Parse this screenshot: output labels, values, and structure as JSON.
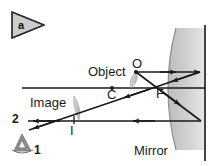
{
  "figure": {
    "panel_label": "a",
    "background_color": "#ffffff",
    "ink_color": "#1a1a1a",
    "shade_color": "#c9c9c9"
  },
  "labels": {
    "object": "Object",
    "image": "Image",
    "mirror": "Mirror",
    "point_o": "O",
    "point_c": "C",
    "point_f": "F",
    "point_i": "I",
    "ray_1": "1",
    "ray_2": "2"
  },
  "diagram_data": {
    "type": "optics-ray-diagram",
    "description": "Concave mirror ray diagram: an object beyond the center of curvature forms a real, inverted image between C and F; an eye at lower left views the image.",
    "elements": [
      {
        "name": "principal-axis",
        "kind": "line",
        "x1": 22,
        "y1": 88,
        "x2": 205,
        "y2": 88
      },
      {
        "name": "mirror-surface",
        "kind": "arc",
        "vertex_x": 200,
        "vertex_y": 88,
        "top_x": 178,
        "top_y": 30,
        "bottom_x": 178,
        "bottom_y": 150
      },
      {
        "name": "mirror-back-line",
        "kind": "line",
        "x1": 205,
        "y1": 26,
        "x2": 205,
        "y2": 160
      },
      {
        "name": "object-point-O",
        "kind": "point",
        "x": 136,
        "y": 72
      },
      {
        "name": "center-of-curvature-C",
        "kind": "point",
        "x": 112,
        "y": 88
      },
      {
        "name": "focal-point-F",
        "kind": "point",
        "x": 160,
        "y": 88
      },
      {
        "name": "image-point-I",
        "kind": "point",
        "x": 74,
        "y": 120
      },
      {
        "name": "ray-parallel-incident",
        "kind": "ray",
        "x1": 136,
        "y1": 72,
        "x2": 200,
        "y2": 72,
        "arrow": "mid"
      },
      {
        "name": "ray-parallel-reflected-through-F",
        "kind": "ray",
        "x1": 200,
        "y1": 72,
        "x2": 30,
        "y2": 128,
        "arrow": "mid"
      },
      {
        "name": "ray-through-F-incident",
        "kind": "ray",
        "x1": 136,
        "y1": 72,
        "x2": 200,
        "y2": 120,
        "arrow": "mid"
      },
      {
        "name": "ray-reflected-parallel",
        "kind": "ray",
        "x1": 200,
        "y1": 120,
        "x2": 30,
        "y2": 120,
        "arrow": "mid"
      },
      {
        "name": "eye-observer",
        "kind": "icon",
        "x": 22,
        "y": 140
      }
    ],
    "object_height_units": 16,
    "image_height_units": -32,
    "object_distance_units": 64,
    "image_distance_units": 126
  }
}
